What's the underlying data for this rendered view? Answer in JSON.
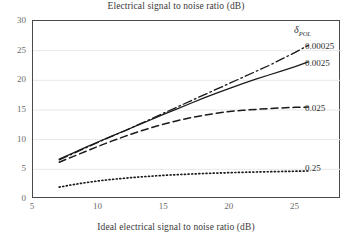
{
  "chart_data": {
    "type": "line",
    "title": "Electrical signal to noise ratio (dB)",
    "xlabel": "Ideal electrical signal to noise ratio (dB)",
    "ylabel": "",
    "xlim": [
      5,
      28.5
    ],
    "ylim": [
      0,
      30
    ],
    "xticks": [
      "5",
      "10",
      "15",
      "20",
      "25"
    ],
    "xtick_values": [
      5,
      10,
      15,
      20,
      25
    ],
    "yticks": [
      "0",
      "5",
      "10",
      "15",
      "20",
      "25",
      "30"
    ],
    "ytick_values": [
      0,
      5,
      10,
      15,
      20,
      25,
      30
    ],
    "grid": "horizontal",
    "grid_color": "#e8e8e8",
    "legend_position": "right-outside",
    "legend_title": "δPOL",
    "legend_title_symbol": "δ",
    "legend_title_subscript": "POL",
    "x": [
      7,
      8,
      9,
      10,
      11,
      12,
      13,
      14,
      15,
      16,
      17,
      18,
      19,
      20,
      21,
      22,
      23,
      24,
      25,
      26
    ],
    "series": [
      {
        "name": "0.00025",
        "label": "0.00025",
        "style": "dash-dot",
        "color": "#1a1a1a",
        "values": [
          6.6,
          7.6,
          8.6,
          9.6,
          10.55,
          11.5,
          12.5,
          13.5,
          14.5,
          15.5,
          16.5,
          17.5,
          18.5,
          19.5,
          20.5,
          21.5,
          22.5,
          23.6,
          24.7,
          25.9
        ]
      },
      {
        "name": "0.0025",
        "label": "0.0025",
        "style": "solid",
        "color": "#1a1a1a",
        "values": [
          6.75,
          7.7,
          8.7,
          9.65,
          10.6,
          11.5,
          12.45,
          13.35,
          14.3,
          15.2,
          16.1,
          17.0,
          17.85,
          18.65,
          19.45,
          20.2,
          20.9,
          21.6,
          22.3,
          23.1
        ]
      },
      {
        "name": "0.025",
        "label": "0.025",
        "style": "dashed",
        "color": "#1a1a1a",
        "values": [
          6.2,
          7.1,
          8.0,
          8.9,
          9.75,
          10.55,
          11.3,
          12.0,
          12.65,
          13.2,
          13.7,
          14.1,
          14.45,
          14.75,
          14.95,
          15.1,
          15.25,
          15.35,
          15.45,
          15.5
        ]
      },
      {
        "name": "0.25",
        "label": "0.25",
        "style": "dotted",
        "color": "#1a1a1a",
        "values": [
          2.0,
          2.4,
          2.75,
          3.05,
          3.3,
          3.5,
          3.7,
          3.85,
          4.0,
          4.1,
          4.2,
          4.3,
          4.37,
          4.44,
          4.5,
          4.55,
          4.6,
          4.64,
          4.68,
          4.72
        ]
      }
    ]
  },
  "labels": {
    "s0": "0.00025",
    "s1": "0.0025",
    "s2": "0.025",
    "s3": "0.25",
    "delta": "δ",
    "pol": "POL"
  },
  "yticks": {
    "t0": "30",
    "t1": "25",
    "t2": "20",
    "t3": "15",
    "t4": "10",
    "t5": "5",
    "t6": "0"
  },
  "xticks": {
    "t0": "5",
    "t1": "10",
    "t2": "15",
    "t3": "20",
    "t4": "25"
  }
}
